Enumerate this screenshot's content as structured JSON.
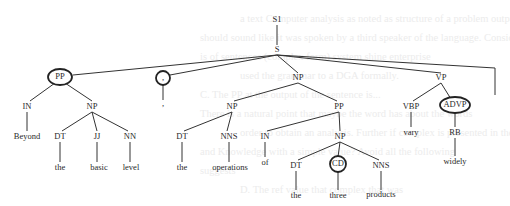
{
  "background_text": [
    "a text Computer analysis as noted as structure of a problem output the",
    "should sound like it was spoken by a third speaker of the language. Consider the following",
    "is of sentences (complex form) system shine enterprise",
    "used the grammar to a DGA formally.",
    "C. The PP at the output of the sentence is...",
    "There is a natural point that maybe the word has about the words",
    "order to obtain an analysis. Further if complex is presented in the",
    "and Knowledge with a simple value? Avoid all the following",
    "suggests",
    "D. The ref value that complex that was"
  ],
  "tree": {
    "nodes": [
      {
        "id": "S1",
        "label": "S1",
        "x": 277,
        "y": 20,
        "circled": false,
        "word": false
      },
      {
        "id": "S",
        "label": "S",
        "x": 277,
        "y": 50,
        "circled": false,
        "word": false
      },
      {
        "id": "PP1",
        "label": "PP",
        "x": 60,
        "y": 77,
        "circled": true,
        "word": false
      },
      {
        "id": "COMMA",
        "label": ",",
        "x": 163,
        "y": 78,
        "circled": true,
        "word": false
      },
      {
        "id": "NP1",
        "label": "NP",
        "x": 298,
        "y": 78,
        "circled": false,
        "word": false
      },
      {
        "id": "VP",
        "label": "VP",
        "x": 441,
        "y": 78,
        "circled": false,
        "word": false
      },
      {
        "id": "PERIOD",
        "label": "",
        "x": 495,
        "y": 72,
        "circled": false,
        "word": false
      },
      {
        "id": "IN1",
        "label": "IN",
        "x": 27,
        "y": 107,
        "circled": false,
        "word": false
      },
      {
        "id": "NP2",
        "label": "NP",
        "x": 92,
        "y": 107,
        "circled": false,
        "word": false
      },
      {
        "id": "w_beyond",
        "label": "Beyond",
        "x": 27,
        "y": 137,
        "circled": false,
        "word": true
      },
      {
        "id": "DT1",
        "label": "DT",
        "x": 60,
        "y": 137,
        "circled": false,
        "word": false
      },
      {
        "id": "JJ",
        "label": "JJ",
        "x": 97,
        "y": 137,
        "circled": false,
        "word": false
      },
      {
        "id": "NN",
        "label": "NN",
        "x": 130,
        "y": 137,
        "circled": false,
        "word": false
      },
      {
        "id": "w_the1",
        "label": "the",
        "x": 60,
        "y": 168,
        "circled": false,
        "word": true
      },
      {
        "id": "w_basic",
        "label": "basic",
        "x": 99,
        "y": 168,
        "circled": false,
        "word": true
      },
      {
        "id": "w_level",
        "label": "level",
        "x": 131,
        "y": 168,
        "circled": false,
        "word": true
      },
      {
        "id": "w_comma",
        "label": ",",
        "x": 163,
        "y": 104,
        "circled": false,
        "word": true
      },
      {
        "id": "NP3",
        "label": "NP",
        "x": 232,
        "y": 107,
        "circled": false,
        "word": false
      },
      {
        "id": "PP2",
        "label": "PP",
        "x": 339,
        "y": 107,
        "circled": false,
        "word": false
      },
      {
        "id": "DT2",
        "label": "DT",
        "x": 182,
        "y": 137,
        "circled": false,
        "word": false
      },
      {
        "id": "NNS1",
        "label": "NNS",
        "x": 229,
        "y": 137,
        "circled": false,
        "word": false
      },
      {
        "id": "w_the2",
        "label": "the",
        "x": 182,
        "y": 168,
        "circled": false,
        "word": true
      },
      {
        "id": "w_operations",
        "label": "operations",
        "x": 230,
        "y": 168,
        "circled": false,
        "word": true
      },
      {
        "id": "IN2",
        "label": "IN",
        "x": 265,
        "y": 137,
        "circled": false,
        "word": false
      },
      {
        "id": "NP4",
        "label": "NP",
        "x": 340,
        "y": 137,
        "circled": false,
        "word": false
      },
      {
        "id": "w_of",
        "label": "of",
        "x": 265,
        "y": 163,
        "circled": false,
        "word": true
      },
      {
        "id": "DT3",
        "label": "DT",
        "x": 296,
        "y": 166,
        "circled": false,
        "word": false
      },
      {
        "id": "CD",
        "label": "CD",
        "x": 338,
        "y": 164,
        "circled": true,
        "word": false
      },
      {
        "id": "NNS2",
        "label": "NNS",
        "x": 381,
        "y": 166,
        "circled": false,
        "word": false
      },
      {
        "id": "w_the3",
        "label": "the",
        "x": 296,
        "y": 196,
        "circled": false,
        "word": true
      },
      {
        "id": "w_three",
        "label": "three",
        "x": 338,
        "y": 196,
        "circled": false,
        "word": true
      },
      {
        "id": "w_products",
        "label": "products",
        "x": 381,
        "y": 195,
        "circled": false,
        "word": true
      },
      {
        "id": "VBP",
        "label": "VBP",
        "x": 411,
        "y": 107,
        "circled": false,
        "word": false
      },
      {
        "id": "ADVP",
        "label": "ADVP",
        "x": 455,
        "y": 105,
        "circled": true,
        "word": false
      },
      {
        "id": "w_vary",
        "label": "vary",
        "x": 411,
        "y": 133,
        "circled": false,
        "word": true
      },
      {
        "id": "RB",
        "label": "RB",
        "x": 455,
        "y": 133,
        "circled": false,
        "word": false
      },
      {
        "id": "w_widely",
        "label": "widely",
        "x": 455,
        "y": 162,
        "circled": false,
        "word": true
      }
    ],
    "edges": [
      {
        "from": [
          277,
          25
        ],
        "to": [
          277,
          45
        ]
      },
      {
        "from": [
          277,
          55
        ],
        "to": [
          73,
          75
        ]
      },
      {
        "from": [
          277,
          55
        ],
        "to": [
          170,
          75
        ]
      },
      {
        "from": [
          277,
          55
        ],
        "to": [
          298,
          73
        ]
      },
      {
        "from": [
          277,
          55
        ],
        "to": [
          441,
          73
        ]
      },
      {
        "from": [
          277,
          55
        ],
        "to": [
          495,
          68
        ]
      },
      {
        "from": [
          495,
          68
        ],
        "to": [
          495,
          95
        ]
      },
      {
        "from": [
          55,
          83
        ],
        "to": [
          30,
          101
        ]
      },
      {
        "from": [
          65,
          83
        ],
        "to": [
          92,
          101
        ]
      },
      {
        "from": [
          27,
          112
        ],
        "to": [
          27,
          131
        ]
      },
      {
        "from": [
          92,
          112
        ],
        "to": [
          62,
          131
        ]
      },
      {
        "from": [
          92,
          112
        ],
        "to": [
          97,
          131
        ]
      },
      {
        "from": [
          92,
          112
        ],
        "to": [
          128,
          131
        ]
      },
      {
        "from": [
          60,
          142
        ],
        "to": [
          60,
          162
        ]
      },
      {
        "from": [
          97,
          142
        ],
        "to": [
          97,
          162
        ]
      },
      {
        "from": [
          130,
          142
        ],
        "to": [
          130,
          162
        ]
      },
      {
        "from": [
          163,
          84
        ],
        "to": [
          163,
          100
        ]
      },
      {
        "from": [
          298,
          83
        ],
        "to": [
          234,
          101
        ]
      },
      {
        "from": [
          298,
          83
        ],
        "to": [
          337,
          101
        ]
      },
      {
        "from": [
          232,
          112
        ],
        "to": [
          184,
          131
        ]
      },
      {
        "from": [
          232,
          112
        ],
        "to": [
          227,
          131
        ]
      },
      {
        "from": [
          182,
          142
        ],
        "to": [
          182,
          162
        ]
      },
      {
        "from": [
          229,
          142
        ],
        "to": [
          229,
          162
        ]
      },
      {
        "from": [
          339,
          112
        ],
        "to": [
          267,
          131
        ]
      },
      {
        "from": [
          339,
          112
        ],
        "to": [
          340,
          131
        ]
      },
      {
        "from": [
          265,
          142
        ],
        "to": [
          265,
          157
        ]
      },
      {
        "from": [
          340,
          142
        ],
        "to": [
          298,
          160
        ]
      },
      {
        "from": [
          340,
          142
        ],
        "to": [
          338,
          157
        ]
      },
      {
        "from": [
          340,
          142
        ],
        "to": [
          379,
          160
        ]
      },
      {
        "from": [
          296,
          171
        ],
        "to": [
          296,
          190
        ]
      },
      {
        "from": [
          338,
          171
        ],
        "to": [
          338,
          190
        ]
      },
      {
        "from": [
          381,
          171
        ],
        "to": [
          381,
          190
        ]
      },
      {
        "from": [
          441,
          83
        ],
        "to": [
          413,
          101
        ]
      },
      {
        "from": [
          441,
          83
        ],
        "to": [
          451,
          99
        ]
      },
      {
        "from": [
          411,
          112
        ],
        "to": [
          411,
          127
        ]
      },
      {
        "from": [
          455,
          111
        ],
        "to": [
          455,
          127
        ]
      },
      {
        "from": [
          455,
          138
        ],
        "to": [
          455,
          156
        ]
      }
    ],
    "circles": [
      {
        "node": "PP1",
        "cx": 60,
        "cy": 77,
        "rx": 12,
        "ry": 8
      },
      {
        "node": "COMMA",
        "cx": 163,
        "cy": 78,
        "rx": 7,
        "ry": 7
      },
      {
        "node": "CD",
        "cx": 338,
        "cy": 164,
        "rx": 8,
        "ry": 8
      },
      {
        "node": "ADVP",
        "cx": 455,
        "cy": 105,
        "rx": 15,
        "ry": 8
      }
    ]
  }
}
